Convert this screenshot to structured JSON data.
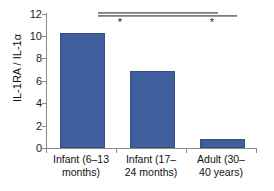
{
  "chart_data": {
    "type": "bar",
    "title": "",
    "xlabel": "",
    "ylabel": "IL-1RA / IL-1α",
    "ylim": [
      0,
      12
    ],
    "ytick_labels": [
      "0",
      "2",
      "4",
      "6",
      "8",
      "10",
      "12"
    ],
    "ytick_values": [
      0,
      2,
      4,
      6,
      8,
      10,
      12
    ],
    "grid": false,
    "legend": "none",
    "bar_color": "#3e5f9b",
    "categories": [
      "Infant (6–13 months)",
      "Infant  (17–24 months)",
      "Adult (30–40 years)"
    ],
    "category_lines": [
      {
        "line1": "Infant (6–13",
        "line2": "months)"
      },
      {
        "line1": "Infant  (17–",
        "line2": "24 months)"
      },
      {
        "line1": "Adult (30–",
        "line2": "40 years)"
      }
    ],
    "values": [
      10.3,
      6.9,
      0.8
    ],
    "annotations": [
      {
        "label": "*",
        "comparison": "Infant (6–13 months) vs Infant (17–24 months)"
      },
      {
        "label": "*",
        "comparison": "Infant (6–13 months) vs Adult (30–40 years)"
      }
    ]
  }
}
